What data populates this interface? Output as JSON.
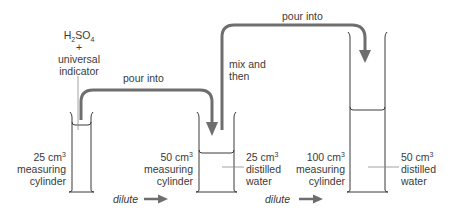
{
  "diagram": {
    "colors": {
      "ink": "#3a3a3a",
      "arrow": "#6e6e6e",
      "cylinder": "#3a3a3a",
      "pointer": "#8a8a8a",
      "background": "#ffffff"
    },
    "reagent": {
      "formula_main": "H",
      "formula_sub1": "2",
      "formula_mid": "SO",
      "formula_sub2": "4",
      "plus": "+",
      "line1": "universal",
      "line2": "indicator"
    },
    "cylinders": [
      {
        "id": "cyl-25",
        "volume_value": "25 cm",
        "volume_sup": "3",
        "type_line1": "measuring",
        "type_line2": "cylinder"
      },
      {
        "id": "cyl-50",
        "volume_value": "50 cm",
        "volume_sup": "3",
        "type_line1": "measuring",
        "type_line2": "cylinder",
        "contents_value": "25 cm",
        "contents_sup": "3",
        "contents_line1": "distilled",
        "contents_line2": "water"
      },
      {
        "id": "cyl-100",
        "volume_value": "100 cm",
        "volume_sup": "3",
        "type_line1": "measuring",
        "type_line2": "cylinder",
        "contents_value": "50 cm",
        "contents_sup": "3",
        "contents_line1": "distilled",
        "contents_line2": "water"
      }
    ],
    "arrows": {
      "pour1": "pour into",
      "pour2": "pour into",
      "mix_line1": "mix and",
      "mix_line2": "then",
      "dilute1": "dilute",
      "dilute2": "dilute"
    }
  }
}
